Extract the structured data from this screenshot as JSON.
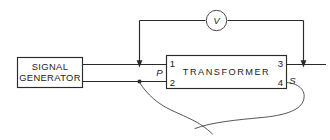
{
  "diagram": {
    "background_color": "#ffffff",
    "line_color": "#2b2b2b",
    "components": {
      "signal_generator": {
        "label_line1": "SIGNAL",
        "label_line2": "GENERATOR"
      },
      "transformer": {
        "label": "TRANSFORMER",
        "terminals": {
          "t1": "1",
          "t2": "2",
          "t3": "3",
          "t4": "4"
        },
        "primary_label": "P",
        "secondary_label": "S"
      },
      "voltmeter": {
        "label": "V",
        "symbol_name": "voltmeter-circle"
      }
    },
    "annotations": {
      "arrow_left_name": "probe-arrow-left",
      "arrow_right_name": "probe-arrow-right",
      "junction_name": "junction-dot"
    }
  }
}
